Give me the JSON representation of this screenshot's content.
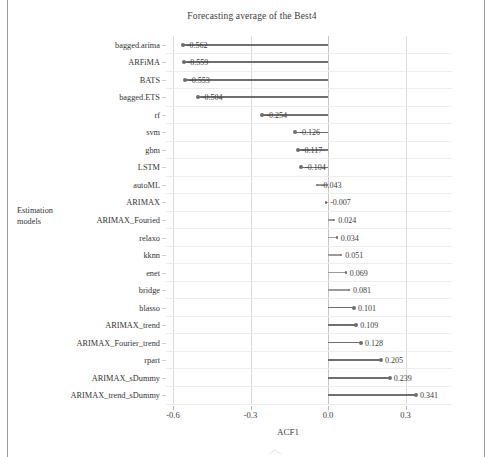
{
  "figure": {
    "title": "Forecasting average of the Best4",
    "x_axis_title": "ACF1",
    "y_axis_title_line1": "Estimation",
    "y_axis_title_line2": "models",
    "accent_color": "#6e6e6e",
    "grid_color": "#dcdcdc"
  },
  "chart_data": {
    "type": "bar",
    "title": "Forecasting average of the Best4",
    "xlabel": "ACF1",
    "ylabel": "Estimation models",
    "orientation": "horizontal",
    "baseline": 0.0,
    "xlim": [
      -0.75,
      0.42
    ],
    "xticks": [
      "-0.6",
      "-0.3",
      "0.0",
      "0.3"
    ],
    "xtick_values": [
      -0.6,
      -0.3,
      0.0,
      0.3
    ],
    "grid": true,
    "legend": "none",
    "categories": [
      "bagged.arima",
      "ARFiMA",
      "BATS",
      "bagged.ETS",
      "rf",
      "svm",
      "gbm",
      "LSTM",
      "autoML",
      "ARIMAX",
      "ARIMAX_Fouried",
      "relaxo",
      "kknn",
      "enet",
      "bridge",
      "blasso",
      "ARIMAX_trend",
      "ARIMAX_Fourier_trend",
      "rpart",
      "ARIMAX_sDummy",
      "ARIMAX_trend_sDummy"
    ],
    "values": [
      -0.562,
      -0.559,
      -0.553,
      -0.504,
      -0.254,
      -0.126,
      -0.117,
      -0.104,
      -0.043,
      -0.007,
      0.024,
      0.034,
      0.051,
      0.069,
      0.081,
      0.101,
      0.109,
      0.128,
      0.205,
      0.239,
      0.341
    ],
    "value_labels": [
      "-0.562",
      "-0.559",
      "-0.553",
      "-0.504",
      "-0.254",
      "-0.126",
      "-0.117",
      "-0.104",
      "-0.043",
      "-0.007",
      "0.024",
      "0.034",
      "0.051",
      "0.069",
      "0.081",
      "0.101",
      "0.109",
      "0.128",
      "0.205",
      "0.239",
      "0.341"
    ]
  }
}
